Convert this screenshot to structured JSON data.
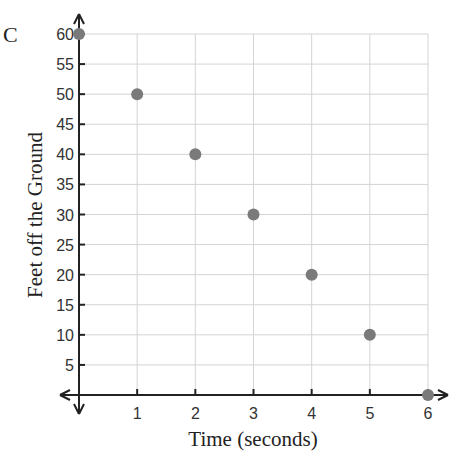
{
  "corner_label": "C",
  "chart_data": {
    "type": "scatter",
    "title": "",
    "xlabel": "Time (seconds)",
    "ylabel": "Feet off the Ground",
    "x_ticks": [
      "1",
      "2",
      "3",
      "4",
      "5",
      "6"
    ],
    "y_ticks": [
      "5",
      "10",
      "15",
      "20",
      "25",
      "30",
      "35",
      "40",
      "45",
      "50",
      "55",
      "60"
    ],
    "xlim": [
      0,
      6
    ],
    "ylim": [
      0,
      60
    ],
    "grid": true,
    "legend": null,
    "series": [
      {
        "name": "points",
        "color": "#7a7a7a",
        "x": [
          0,
          1,
          2,
          3,
          4,
          5,
          6
        ],
        "y": [
          60,
          50,
          40,
          30,
          20,
          10,
          0
        ]
      }
    ]
  },
  "colors": {
    "grid": "#d4d4d4",
    "axis": "#222222",
    "point": "#7a7a7a"
  }
}
